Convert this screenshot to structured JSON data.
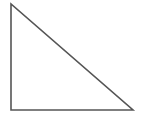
{
  "figure": {
    "name": "right-triangle",
    "title": "Right triangle",
    "background_color": "#ffffff",
    "stroke_color": "#555555",
    "stroke_width": 1.6,
    "fill": "none",
    "canvas": {
      "width": 145,
      "height": 117
    },
    "vertices": [
      {
        "label": "top-left",
        "x": 11,
        "y": 4
      },
      {
        "label": "bottom-left",
        "x": 11,
        "y": 110
      },
      {
        "label": "bottom-right",
        "x": 133,
        "y": 110
      }
    ],
    "edges": [
      {
        "name": "vertical-leg",
        "from": "top-left",
        "to": "bottom-left",
        "length": 106
      },
      {
        "name": "horizontal-leg",
        "from": "bottom-left",
        "to": "bottom-right",
        "length": 122
      },
      {
        "name": "hypotenuse",
        "from": "bottom-right",
        "to": "top-left",
        "length": 162
      }
    ],
    "right_angle_at": "bottom-left",
    "path": "M 11 4 L 11 110 L 133 110 Z"
  }
}
